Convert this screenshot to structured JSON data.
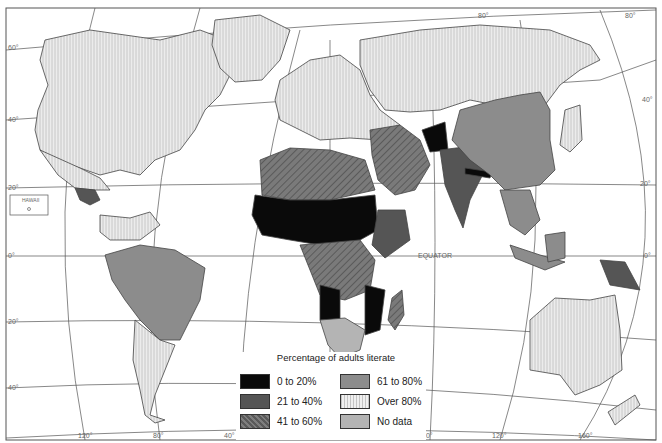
{
  "map": {
    "title": "World adult literacy",
    "labels": {
      "equator": "EQUATOR",
      "hawaii": "HAWAII",
      "lat_left": [
        "60°",
        "40°",
        "20°",
        "0°",
        "20°",
        "40°"
      ],
      "lat_right": [
        "40°",
        "20°",
        "0°"
      ],
      "lon_bottom": [
        "120°",
        "80°",
        "40°",
        "80°",
        "120°",
        "160°"
      ],
      "lon_top": [
        "80°",
        "80°"
      ]
    }
  },
  "legend": {
    "title": "Percentage of adults literate",
    "items": [
      {
        "label": "0 to 20%",
        "color": "#0a0a0a",
        "pattern": "solid"
      },
      {
        "label": "21 to 40%",
        "color": "#555555",
        "pattern": "solid"
      },
      {
        "label": "41 to 60%",
        "color": "#6e6e6e",
        "pattern": "diagonal-hatch"
      },
      {
        "label": "61 to 80%",
        "color": "#8c8c8c",
        "pattern": "solid"
      },
      {
        "label": "Over 80%",
        "color": "#e6e6e6",
        "pattern": "vertical-lines"
      },
      {
        "label": "No data",
        "color": "#b4b4b4",
        "pattern": "solid"
      }
    ]
  }
}
